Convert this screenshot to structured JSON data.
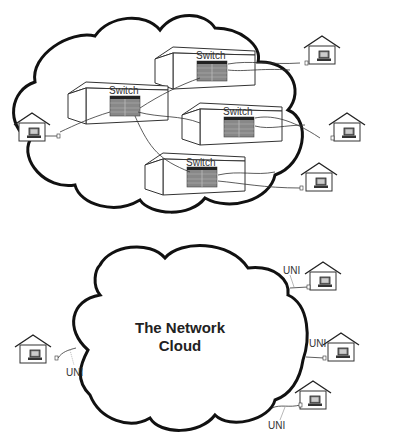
{
  "top_diagram": {
    "description": "Network cloud with internal switches",
    "switches": [
      {
        "label": "Switch"
      },
      {
        "label": "Switch"
      },
      {
        "label": "Switch"
      },
      {
        "label": "Switch"
      }
    ],
    "houses": 4
  },
  "bottom_diagram": {
    "cloud_title_line1": "The Network",
    "cloud_title_line2": "Cloud",
    "uni_labels": [
      "UNI",
      "UNI",
      "UNI",
      "UNI"
    ],
    "houses": 4
  }
}
